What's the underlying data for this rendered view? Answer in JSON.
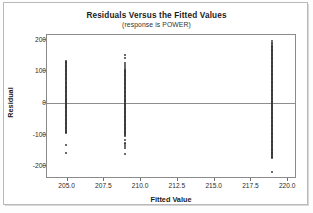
{
  "chart_data": {
    "type": "scatter",
    "title": "Residuals Versus the Fitted Values",
    "subtitle": "(response is POWER)",
    "xlabel": "Fitted Value",
    "ylabel": "Residual",
    "xlim": [
      203.6,
      220.6
    ],
    "ylim": [
      -240,
      215
    ],
    "grid": false,
    "legend": false,
    "reference_line_y": 0,
    "xticks": [
      "205.0",
      "207.5",
      "210.0",
      "212.5",
      "215.0",
      "217.5",
      "220.0"
    ],
    "xtick_values": [
      205.0,
      207.5,
      210.0,
      212.5,
      215.0,
      217.5,
      220.0
    ],
    "yticks": [
      "200",
      "100",
      "0",
      "-100",
      "-200"
    ],
    "ytick_values": [
      200,
      100,
      0,
      -100,
      -200
    ],
    "series": [
      {
        "name": "Fitted 204.9",
        "x": 204.9,
        "dense_band": [
          -95,
          133
        ],
        "outliers": [
          -133,
          -157
        ]
      },
      {
        "name": "Fitted 208.9",
        "x": 208.9,
        "dense_band": [
          -103,
          107
        ],
        "outliers": [
          151,
          143,
          126,
          121,
          113,
          -118,
          -128,
          -136,
          -143,
          -162
        ]
      },
      {
        "name": "Fitted 218.9",
        "x": 218.9,
        "dense_band": [
          -172,
          181
        ],
        "outliers": [
          196,
          188,
          -218
        ]
      }
    ]
  }
}
